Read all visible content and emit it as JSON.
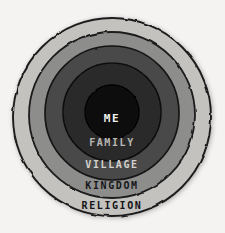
{
  "diagram": {
    "background_color": "#f4f3f1",
    "style": "hand-drawn ink and grey wash",
    "center_x": 112,
    "center_y": 117,
    "outline_color": "#1c1c1c",
    "levels": [
      {
        "label": "ME",
        "order": 1,
        "radius": 27,
        "fill_color": "#0d0d0d",
        "text_color": "#f2f1ee",
        "label_x": 112,
        "label_y": 122,
        "font_size": 11
      },
      {
        "label": "FAMILY",
        "order": 2,
        "radius": 49,
        "fill_color": "#2b2b2b",
        "text_color": "#b9b7b2",
        "label_x": 112,
        "label_y": 146,
        "font_size": 10
      },
      {
        "label": "VILLAGE",
        "order": 3,
        "radius": 67,
        "fill_color": "#4a4a4a",
        "text_color": "#d3d1cc",
        "label_x": 112,
        "label_y": 168,
        "font_size": 10
      },
      {
        "label": "KINGDOM",
        "order": 4,
        "radius": 83,
        "fill_color": "#8d8d8b",
        "text_color": "#17161a",
        "label_x": 112,
        "label_y": 189,
        "font_size": 10
      },
      {
        "label": "RELIGION",
        "order": 5,
        "radius": 99,
        "fill_color": "#c3c2bf",
        "text_color": "#141316",
        "label_x": 112,
        "label_y": 209,
        "font_size": 10
      }
    ]
  }
}
